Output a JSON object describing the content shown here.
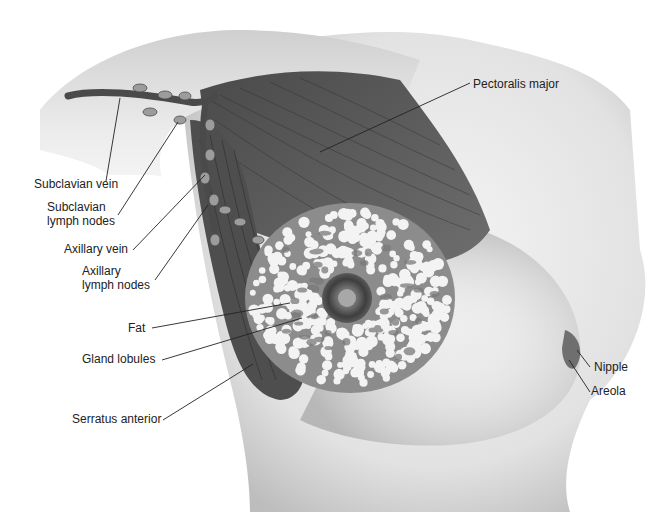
{
  "figure": {
    "type": "anatomical-illustration"
  },
  "labels": {
    "pectoralis_major": "Pectoralis major",
    "subclavian_vein": "Subclavian vein",
    "subclavian_lymph_nodes_1": "Subclavian",
    "subclavian_lymph_nodes_2": "lymph nodes",
    "axillary_vein": "Axillary vein",
    "axillary_lymph_nodes_1": "Axillary",
    "axillary_lymph_nodes_2": "lymph nodes",
    "fat": "Fat",
    "gland_lobules": "Gland lobules",
    "serratus_anterior": "Serratus anterior",
    "nipple": "Nipple",
    "areola": "Areola"
  }
}
